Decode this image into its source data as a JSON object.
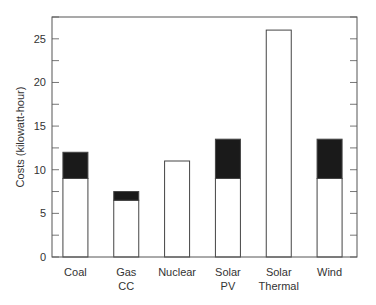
{
  "chart_data": {
    "type": "bar",
    "stacked": true,
    "title": "",
    "xlabel": "",
    "ylabel": "Costs (kilowatt-hour)",
    "ylim": [
      0,
      27.5
    ],
    "yticks": [
      0,
      5,
      10,
      15,
      20,
      25
    ],
    "minor_ytick_step": 2.5,
    "grid": false,
    "legend": null,
    "categories": [
      {
        "lines": [
          "Coal"
        ]
      },
      {
        "lines": [
          "Gas",
          "CC"
        ]
      },
      {
        "lines": [
          "Nuclear"
        ]
      },
      {
        "lines": [
          "Solar",
          "PV"
        ]
      },
      {
        "lines": [
          "Solar",
          "Thermal"
        ]
      },
      {
        "lines": [
          "Wind"
        ]
      }
    ],
    "series": [
      {
        "name": "base",
        "color": "#ffffff",
        "values": [
          9,
          6.5,
          11,
          9,
          26,
          9
        ]
      },
      {
        "name": "additional",
        "color": "#1a1a1a",
        "values": [
          3,
          1,
          0,
          4.5,
          0,
          4.5
        ]
      }
    ],
    "totals": [
      12,
      7.5,
      11,
      13.5,
      26,
      13.5
    ]
  }
}
